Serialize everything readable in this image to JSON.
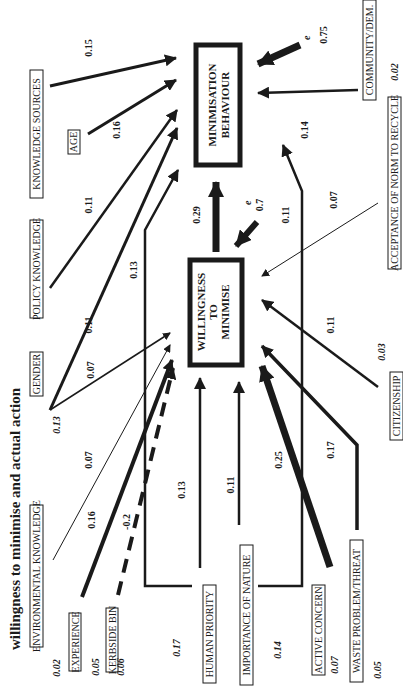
{
  "title": "willingness to minimise and actual action",
  "central_nodes": {
    "willingness": {
      "line1": "WILLINGNESS",
      "line2": "TO",
      "line3": "MINIMISE",
      "error_label": "e",
      "error_value": "0.7"
    },
    "behaviour": {
      "line1": "MINIMISATION",
      "line2": "BEHAVIOUR",
      "error_label": "e",
      "error_value": "0.75"
    }
  },
  "path_willingness_to_behaviour": "0.29",
  "variables": {
    "knowledge_sources": {
      "label": "KNOWLEDGE SOURCES",
      "coef_behaviour": "0.15"
    },
    "age": {
      "label": "AGE",
      "coef_behaviour": "0.16"
    },
    "policy_knowledge": {
      "label": "POLICY KNOWLEDGE",
      "coef_behaviour": "0.11"
    },
    "gender": {
      "label": "GENDER",
      "r2": "0.13",
      "coef_behaviour": "0.11",
      "coef_willingness": "0.07"
    },
    "environmental_knowledge": {
      "label": "ENVIRONMENTAL KNOWLEDGE",
      "r2": "0.02",
      "coef_willingness": "0.07"
    },
    "experience": {
      "label": "EXPERIENCE",
      "r2": "0.05",
      "coef_willingness": "0.16"
    },
    "kerbside_bin": {
      "label": "KERBSIDE BIN",
      "r2": "0.06",
      "coef_willingness": "-0.2"
    },
    "human_priority": {
      "label": "HUMAN PRIORITY",
      "r2": "0.17",
      "coef_willingness": "0.13",
      "coef_behaviour": "0.13"
    },
    "importance_of_nature": {
      "label": "IMPORTANCE OF NATURE",
      "coef_willingness": "0.11"
    },
    "active_concern": {
      "label": "ACTIVE CONCERN",
      "r2": "0.14",
      "r2_b": "0.07",
      "coef_willingness": "0.25",
      "coef_behaviour": "0.11"
    },
    "waste_problem_threat": {
      "label": "WASTE PROBLEM/THREAT",
      "r2": "0.05",
      "coef_willingness": "0.17"
    },
    "citizenship": {
      "label": "CITIZENSHIP",
      "r2": "0.03",
      "coef_willingness": "0.11"
    },
    "acceptance_of_norm": {
      "label": "ACCEPTANCE OF NORM TO RECYCLE",
      "r2": "0.02",
      "coef_willingness": "0.07"
    },
    "community_dem": {
      "label": "COMMUNITY/DEM.",
      "coef_behaviour": "0.14"
    }
  }
}
